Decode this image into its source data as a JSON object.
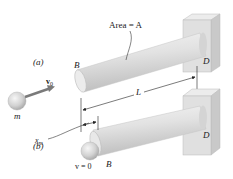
{
  "figure": {
    "type": "mechanics-diagram",
    "labels": {
      "area": "Area = A",
      "part_a": "(a)",
      "part_b": "(b)",
      "end_b_top": "B",
      "end_d_top": "D",
      "end_b_bottom": "B",
      "end_d_bottom": "D",
      "length": "L",
      "mass": "m",
      "velocity_initial": "v",
      "velocity_initial_sub": "0",
      "deflection": "x",
      "deflection_sub": "m",
      "velocity_final": "v = 0"
    },
    "colors": {
      "rod_light": "#f2f2f2",
      "rod_mid": "#d9d9d9",
      "rod_dark": "#b8b8b8",
      "wall_front": "#cfcfcf",
      "wall_side": "#e4e4e4",
      "wall_top": "#ececec",
      "ball_light": "#f0f0f0",
      "ball_dark": "#a9a9a9",
      "arrow": "#7a7a7a",
      "line": "#222222"
    }
  }
}
